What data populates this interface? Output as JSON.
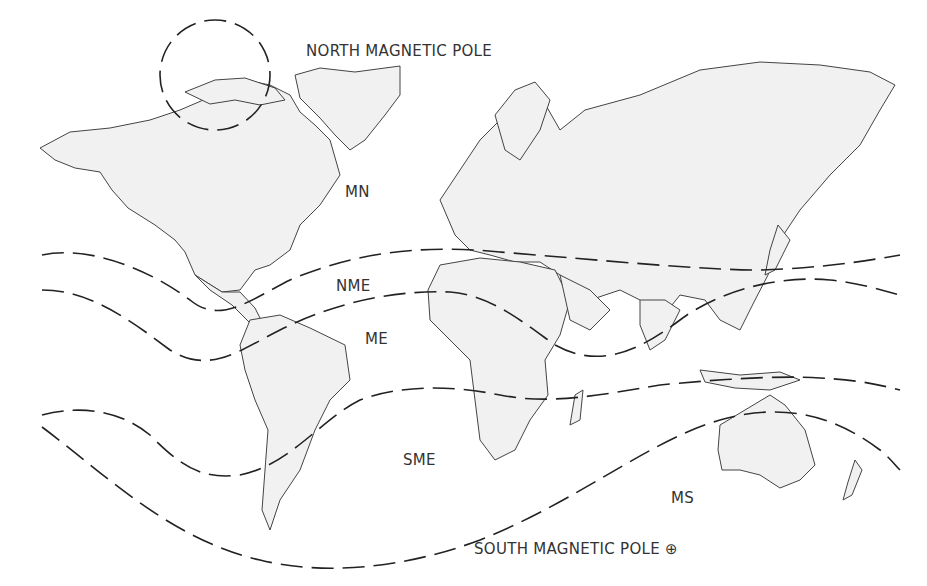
{
  "map": {
    "title": "Magnetic zones world map",
    "labels": {
      "north_pole": "NORTH MAGNETIC POLE",
      "south_pole": "SOUTH MAGNETIC POLE ⊕",
      "mn": "MN",
      "nme": "NME",
      "me": "ME",
      "sme": "SME",
      "ms": "MS"
    },
    "zones": [
      "MN",
      "NME",
      "ME",
      "SME",
      "MS"
    ],
    "colors": {
      "land": "#f1f1f1",
      "outline": "#444444",
      "zone_line": "#222222",
      "text": "#333333"
    }
  }
}
